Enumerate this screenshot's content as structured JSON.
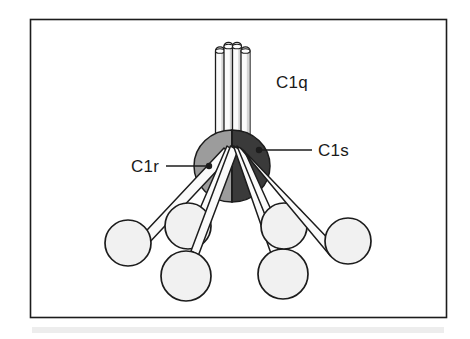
{
  "figure": {
    "background_color": "#ffffff",
    "frame": {
      "name": "figure-frame",
      "x": 30,
      "y": 19,
      "width": 417,
      "height": 299,
      "border_color": "#1c1c1c",
      "fill_color": "#ffffff"
    },
    "footer_band": {
      "name": "scan-artifact-band",
      "color": "#ebebeb"
    }
  },
  "labels": [
    {
      "id": "c1q",
      "text": "C1q",
      "x": 276,
      "y": 88,
      "anchor": "start",
      "has_leader": false
    },
    {
      "id": "c1r",
      "text": "C1r",
      "x": 131,
      "y": 172,
      "anchor": "start",
      "has_leader": true,
      "leader": {
        "x1": 166,
        "y1": 166,
        "x2": 207,
        "y2": 166
      },
      "dot": {
        "cx": 209,
        "cy": 166,
        "r": 3.2
      }
    },
    {
      "id": "c1s",
      "text": "C1s",
      "x": 318,
      "y": 155,
      "anchor": "start",
      "has_leader": true,
      "leader": {
        "x1": 261,
        "y1": 150,
        "x2": 312,
        "y2": 150
      },
      "dot": {
        "cx": 259,
        "cy": 150,
        "r": 3.2
      }
    }
  ],
  "colors": {
    "outline": "#1c1c1c",
    "stalk_fill": "#fcfcfc",
    "stalk_shade": "#d8d8d8",
    "c1r_fill": "#9c9c9c",
    "c1s_fill": "#3a3a3a",
    "arm_fill": "#fafafa",
    "head_fill": "#f1f1f1",
    "leader_line": "#1c1c1c"
  },
  "c1q_stalk": {
    "name": "c1q-collagen-stalk",
    "tube_count": 4,
    "top_y": 43,
    "bottom_y": 140,
    "tubes": [
      {
        "x": 215,
        "width": 9,
        "cap_y": 47
      },
      {
        "x": 223.5,
        "width": 9,
        "cap_y": 43
      },
      {
        "x": 232,
        "width": 9,
        "cap_y": 43
      },
      {
        "x": 240.5,
        "width": 9,
        "cap_y": 47
      }
    ]
  },
  "c1r_c1s_core": {
    "name": "c1r-c1s-tetramer-core",
    "center_x": 232,
    "center_y": 166,
    "radius_x": 38,
    "radius_y": 36,
    "left_half_label": "C1r",
    "right_half_label": "C1s"
  },
  "arms": [
    {
      "id": "arm-1",
      "hinge_x": 228,
      "hinge_y": 152,
      "head_cx": 128,
      "head_cy": 243,
      "head_r": 23,
      "width": 8
    },
    {
      "id": "arm-2",
      "hinge_x": 230,
      "hinge_y": 150,
      "head_cx": 188,
      "head_cy": 226,
      "head_r": 23,
      "width": 8
    },
    {
      "id": "arm-3",
      "hinge_x": 231,
      "hinge_y": 150,
      "head_cx": 186,
      "head_cy": 276,
      "head_r": 25,
      "width": 8
    },
    {
      "id": "arm-4",
      "hinge_x": 234,
      "hinge_y": 150,
      "head_cx": 283,
      "head_cy": 274,
      "head_r": 25,
      "width": 8
    },
    {
      "id": "arm-5",
      "hinge_x": 235,
      "hinge_y": 150,
      "head_cx": 284,
      "head_cy": 226,
      "head_r": 23,
      "width": 8
    },
    {
      "id": "arm-6",
      "hinge_x": 237,
      "hinge_y": 152,
      "head_cx": 348,
      "head_cy": 241,
      "head_r": 23,
      "width": 8
    }
  ]
}
